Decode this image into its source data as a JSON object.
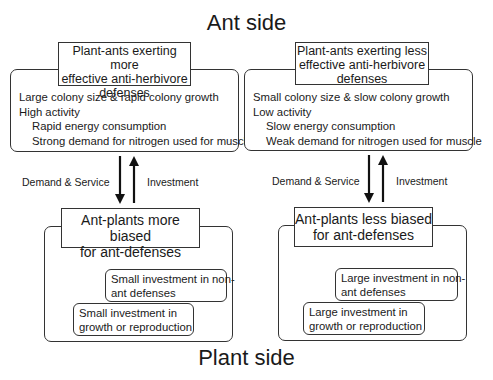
{
  "titles": {
    "top": "Ant side",
    "bottom": "Plant side"
  },
  "left": {
    "ant_header": [
      "Plant-ants exerting more",
      "effective anti-herbivore",
      "defenses"
    ],
    "ant_traits": [
      "Large colony size & rapid colony growth",
      "High activity",
      "Rapid energy consumption",
      "Strong demand for nitrogen used for muscle"
    ],
    "arrow_down_label": "Demand & Service",
    "arrow_up_label": "Investment",
    "plant_header": [
      "Ant-plants more biased",
      "for ant-defenses"
    ],
    "non_ant_box": [
      "Small investment in non-",
      "ant defenses"
    ],
    "growth_box": [
      "Small investment in",
      "growth or reproduction"
    ]
  },
  "right": {
    "ant_header": [
      "Plant-ants exerting less",
      "effective anti-herbivore",
      "defenses"
    ],
    "ant_traits": [
      "Small colony size & slow colony growth",
      "Low activity",
      "Slow energy consumption",
      "Weak demand for nitrogen used for muscle"
    ],
    "arrow_down_label": "Demand & Service",
    "arrow_up_label": "Investment",
    "plant_header": [
      "Ant-plants less biased",
      "for ant-defenses"
    ],
    "non_ant_box": [
      "Large investment in non-",
      "ant defenses"
    ],
    "growth_box": [
      "Large investment in",
      "growth or reproduction"
    ]
  }
}
